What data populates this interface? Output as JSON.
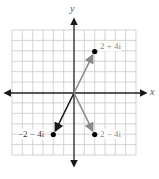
{
  "figure": {
    "type": "complex-plane",
    "axes": {
      "x_label": "x",
      "y_label": "y"
    },
    "grid": {
      "cells_x": 12,
      "cells_y": 12,
      "range_x": [
        -6,
        6
      ],
      "range_y": [
        -6,
        6
      ]
    },
    "colors": {
      "grid": "#c8c8c8",
      "axis": "#222222",
      "gray_vector": "#8a8a8a",
      "black_vector": "#1a1a1a",
      "point": "#000000",
      "gray_label": "#8a8a8a",
      "dark_label": "#333333"
    }
  },
  "points": [
    {
      "label": "2 + 4i",
      "re": 2,
      "im": 4,
      "vector_color": "gray"
    },
    {
      "label": "−2 − 4i",
      "re": -2,
      "im": -4,
      "vector_color": "black"
    },
    {
      "label": "2 − 4i",
      "re": 2,
      "im": -4,
      "vector_color": "gray"
    }
  ]
}
